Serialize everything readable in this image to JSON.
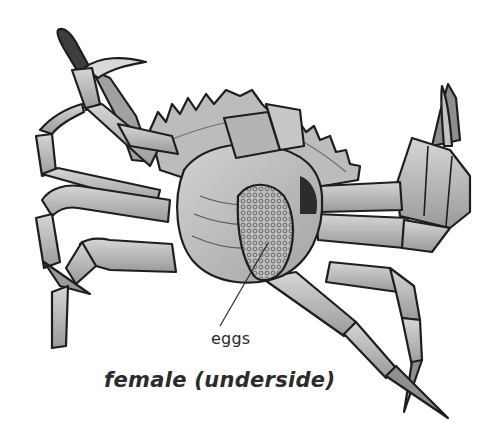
{
  "figure": {
    "view": "underside",
    "style": "grayscale pencil illustration",
    "colors": {
      "background": "#ffffff",
      "outline": "#1e1e1e",
      "shell_light": "#c9c9c9",
      "shell_mid": "#a9a9a9",
      "shell_dark": "#5a5a5a",
      "label_text": "#2a2a2a"
    }
  },
  "labels": {
    "eggs": "eggs"
  },
  "caption": "female (underside)"
}
